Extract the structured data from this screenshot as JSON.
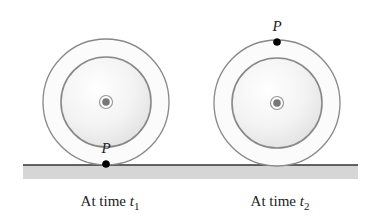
{
  "diagram": {
    "ground": {
      "x1": 23,
      "x2": 358,
      "y": 165,
      "band_height": 14,
      "band_color": "#d6d6d6",
      "line_color": "#333333"
    },
    "wheels": [
      {
        "id": "wheel-t1",
        "cx": 106,
        "cy": 102,
        "outer_r": 63,
        "inner_r": 45,
        "point": {
          "label": "P",
          "cx": 106,
          "cy": 164,
          "label_x": 106,
          "label_y": 153
        },
        "caption": {
          "prefix": "At time ",
          "var": "t",
          "sub": "1",
          "x": 110,
          "y": 206
        }
      },
      {
        "id": "wheel-t2",
        "cx": 277,
        "cy": 103,
        "outer_r": 63,
        "inner_r": 45,
        "point": {
          "label": "P",
          "cx": 277,
          "cy": 42,
          "label_x": 277,
          "label_y": 31
        },
        "caption": {
          "prefix": "At time ",
          "var": "t",
          "sub": "2",
          "x": 280,
          "y": 206
        }
      }
    ],
    "colors": {
      "rim": "#888888",
      "inner_shade": "#ececec",
      "hub_dark": "#777777",
      "point": "#000000",
      "text": "#222222"
    }
  }
}
